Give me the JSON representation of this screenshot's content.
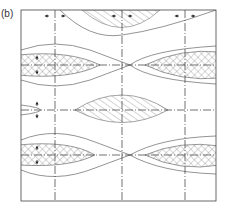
{
  "figure": {
    "label": "(b)",
    "type": "schematic pattern diagram",
    "frame": {
      "x": 21,
      "y": 10,
      "width": 195,
      "height": 191
    },
    "centerlines": {
      "vertical_x": [
        55,
        122,
        185
      ],
      "horizontal_y": [
        65,
        110,
        155
      ]
    },
    "lenses": [
      {
        "id": "top-center-hatched",
        "fill": "hatched",
        "cx": 122,
        "cy": 10
      },
      {
        "id": "left-upper-crosshatched",
        "fill": "crosshatched",
        "cx": 55,
        "cy": 65
      },
      {
        "id": "right-upper-crosshatched",
        "fill": "crosshatched",
        "cx": 185,
        "cy": 65
      },
      {
        "id": "center-hatched",
        "fill": "hatched",
        "cx": 122,
        "cy": 110
      },
      {
        "id": "left-lower-crosshatched",
        "fill": "crosshatched",
        "cx": 55,
        "cy": 155
      },
      {
        "id": "right-lower-crosshatched",
        "fill": "crosshatched",
        "cx": 185,
        "cy": 155
      }
    ],
    "arrows": [
      {
        "orientation": "horizontal",
        "x": 55,
        "y": 16
      },
      {
        "orientation": "horizontal",
        "x": 122,
        "y": 16
      },
      {
        "orientation": "horizontal",
        "x": 185,
        "y": 16
      },
      {
        "orientation": "vertical",
        "x": 37,
        "y": 65
      },
      {
        "orientation": "vertical",
        "x": 37,
        "y": 110
      },
      {
        "orientation": "vertical",
        "x": 37,
        "y": 155
      }
    ],
    "colors": {
      "line": "#555555",
      "hatch": "#999999",
      "frame": "#444444"
    }
  }
}
